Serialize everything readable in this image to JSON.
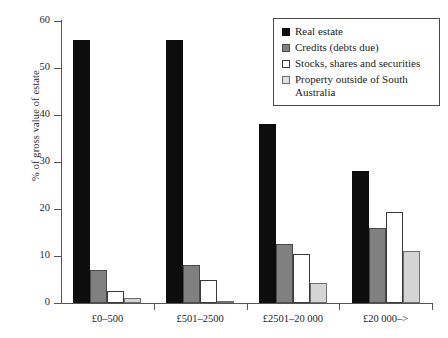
{
  "chart_data": {
    "type": "bar",
    "title": "",
    "xlabel": "",
    "ylabel": "% of gross value of estate",
    "ylim": [
      0,
      60
    ],
    "yticks": [
      0,
      10,
      20,
      30,
      40,
      50,
      60
    ],
    "grid": false,
    "legend_position": "top-right",
    "categories": [
      "£0–500",
      "£501–2500",
      "£2501–20 000",
      "£20 000–>"
    ],
    "series": [
      {
        "name": "Real estate",
        "color": "#0d0d0d",
        "values": [
          56,
          56,
          38,
          28
        ]
      },
      {
        "name": "Credits (debts due)",
        "color": "#808080",
        "values": [
          7,
          8,
          12.5,
          16
        ]
      },
      {
        "name": "Stocks, shares and securities",
        "color": "#ffffff",
        "values": [
          2.5,
          5,
          10.5,
          19.3
        ]
      },
      {
        "name": "Property outside of South Australia",
        "color": "#e2e2e2",
        "values": [
          1,
          0.5,
          4.2,
          11
        ]
      }
    ]
  },
  "legend": {
    "entries": [
      "Real estate",
      "Credits (debts due)",
      "Stocks, shares and securities",
      "Property outside of South Australia"
    ]
  }
}
